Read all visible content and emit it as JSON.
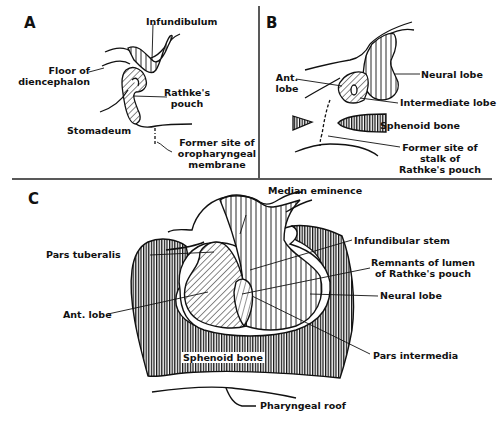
{
  "figure": {
    "panels": [
      {
        "id": "A",
        "letter": "A",
        "labels": {
          "infundibulum": "Infundibulum",
          "floor_line1": "Floor of",
          "floor_line2": "diencephalon",
          "rathke_line1": "Rathke's",
          "rathke_line2": "pouch",
          "stomadeum": "Stomadeum",
          "former_line1": "Former site of",
          "former_line2": "oropharyngeal",
          "former_line3": "membrane"
        }
      },
      {
        "id": "B",
        "letter": "B",
        "labels": {
          "ant_line1": "Ant.",
          "ant_line2": "lobe",
          "neural_lobe": "Neural lobe",
          "intermediate_lobe": "Intermediate lobe",
          "sphenoid_bone": "Sphenoid bone",
          "stalk_line1": "Former site of",
          "stalk_line2": "stalk of",
          "stalk_line3": "Rathke's pouch"
        }
      },
      {
        "id": "C",
        "letter": "C",
        "labels": {
          "median_eminence": "Median eminence",
          "pars_tuberalis": "Pars tuberalis",
          "infundibular_stem": "Infundibular stem",
          "remnants_line1": "Remnants of lumen",
          "remnants_line2": "of Rathke's pouch",
          "neural_lobe": "Neural lobe",
          "ant_lobe": "Ant. lobe",
          "pars_intermedia": "Pars intermedia",
          "sphenoid_bone": "Sphenoid bone",
          "pharyngeal_roof": "Pharyngeal roof"
        }
      }
    ],
    "colors": {
      "ink": "#111111",
      "background": "#ffffff"
    }
  }
}
